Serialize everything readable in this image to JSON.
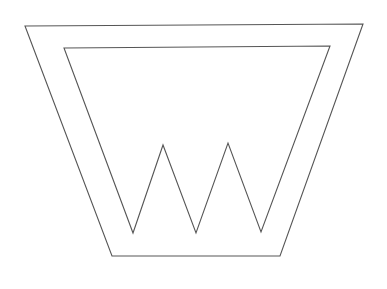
{
  "document": {
    "title": "W Monogram Line Drawing",
    "description": "Outline drawing of a stylized letter W enclosed within a tapering trapezoid frame",
    "background_color": "#ffffff",
    "canvas": {
      "width": 387,
      "height": 289
    }
  },
  "style": {
    "stroke_color": "#565656",
    "stroke_width": 1.1,
    "fill": "none"
  },
  "shapes": {
    "outer_frame": {
      "name": "outer-trapezoid",
      "closed": true,
      "points": "25,26 363,24 280,256 112,256",
      "vertices": [
        {
          "label": "top-left",
          "x": 25,
          "y": 26
        },
        {
          "label": "top-right",
          "x": 363,
          "y": 24
        },
        {
          "label": "bottom-right",
          "x": 280,
          "y": 256
        },
        {
          "label": "bottom-left",
          "x": 112,
          "y": 256
        }
      ]
    },
    "inner_w": {
      "name": "inner-w-letterform",
      "closed": true,
      "points": "64,48 330,46 261,232 228,143 196,233 163,145 133,233",
      "vertices": [
        {
          "label": "top-left",
          "x": 64,
          "y": 48
        },
        {
          "label": "top-right",
          "x": 330,
          "y": 46
        },
        {
          "label": "valley-right",
          "x": 261,
          "y": 232
        },
        {
          "label": "apex-right",
          "x": 228,
          "y": 143
        },
        {
          "label": "valley-middle",
          "x": 196,
          "y": 233
        },
        {
          "label": "apex-left",
          "x": 163,
          "y": 145
        },
        {
          "label": "valley-left",
          "x": 133,
          "y": 233
        }
      ]
    },
    "top_edge_junctions": [
      {
        "label": "junction-left",
        "x": 128,
        "y": 47
      },
      {
        "label": "junction-right",
        "x": 195,
        "y": 46
      }
    ]
  }
}
